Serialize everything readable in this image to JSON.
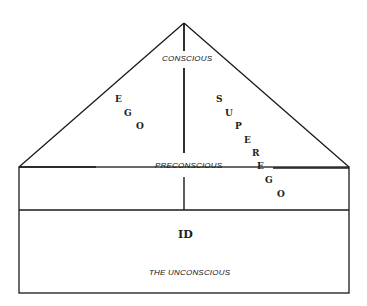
{
  "diagram": {
    "levels": {
      "conscious": "CONSCIOUS",
      "preconscious": "PRECONSCIOUS",
      "unconscious": "THE UNCONSCIOUS"
    },
    "structures": {
      "ego": [
        "E",
        "G",
        "O"
      ],
      "superego": [
        "S",
        "U",
        "P",
        "E",
        "R",
        "E",
        "G",
        "O"
      ],
      "id": "ID"
    },
    "colors": {
      "line": "#1a1a1a",
      "background": "#ffffff"
    }
  }
}
